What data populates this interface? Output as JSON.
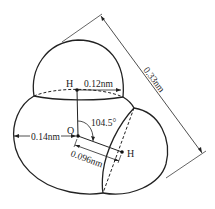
{
  "diagram": {
    "atoms": [
      {
        "symbol": "H",
        "role": "top hydrogen"
      },
      {
        "symbol": "O",
        "role": "oxygen"
      },
      {
        "symbol": "H",
        "role": "right hydrogen"
      }
    ],
    "labels": {
      "h_top": "H",
      "h_right": "H",
      "oxygen": "O",
      "h_radius": "0.12nm",
      "o_radius": "0.14nm",
      "bond_length": "0.096nm",
      "bond_angle": "104.5°",
      "overall_length": "0.33nm"
    },
    "colors": {
      "line": "#222222",
      "background": "#ffffff"
    }
  }
}
